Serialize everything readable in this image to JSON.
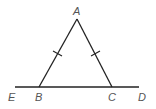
{
  "diagram": {
    "type": "isosceles-triangle-with-extended-base",
    "points": {
      "A": {
        "label": "A",
        "x": 77,
        "y": 19
      },
      "B": {
        "label": "B",
        "x": 39,
        "y": 87
      },
      "C": {
        "label": "C",
        "x": 112,
        "y": 87
      },
      "E": {
        "label": "E",
        "x": 15,
        "y": 87
      },
      "D": {
        "label": "D",
        "x": 139,
        "y": 87
      }
    },
    "labels": {
      "A": "A",
      "B": "B",
      "C": "C",
      "D": "D",
      "E": "E"
    },
    "congruence_marks": [
      "AB",
      "AC"
    ],
    "colors": {
      "line": "#222222",
      "label": "#555555"
    }
  }
}
